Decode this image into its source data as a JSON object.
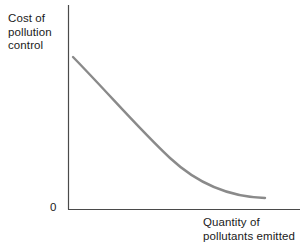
{
  "chart_data": {
    "type": "line",
    "title": "",
    "ylabel": "Cost of\npollution\ncontrol",
    "xlabel": "Quantity of\npollutants emitted",
    "origin_label": "0",
    "grid": false,
    "legend": null,
    "axis_color": "#4a4a4a",
    "curve_color": "#8a8a8a",
    "background_color": "#ffffff",
    "xlim": [
      0,
      1
    ],
    "ylim": [
      0,
      1
    ],
    "x_tick_labels": [],
    "y_tick_labels": [],
    "series": [
      {
        "name": "Cost of pollution control",
        "description": "Convex decreasing curve: marginal cost of pollution control falls as quantity of pollutants emitted rises",
        "x": [
          0.025,
          0.12,
          0.24,
          0.36,
          0.48,
          0.6,
          0.72,
          0.84,
          0.94,
          1.0
        ],
        "y": [
          0.745,
          0.625,
          0.5,
          0.395,
          0.305,
          0.232,
          0.17,
          0.12,
          0.085,
          0.068
        ],
        "path": "M 73,57 C 110,95 140,130 170,158 C 200,186 232,197 265,198"
      }
    ]
  }
}
